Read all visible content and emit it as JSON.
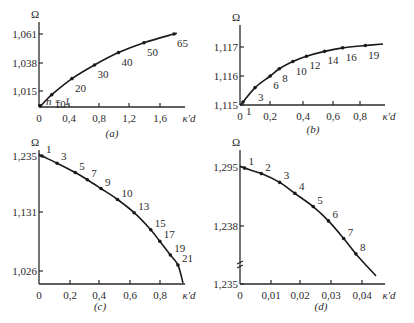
{
  "chart_data": [
    {
      "id": "a",
      "type": "line",
      "caption": "(a)",
      "ylabel": "Ω",
      "xlabel": "κ'd",
      "yticks": [
        "1,015",
        "1,038",
        "1,061"
      ],
      "xticks": [
        "0",
        "0,4",
        "0,8",
        "1,2",
        "1,6"
      ],
      "xlim": [
        0,
        1.9
      ],
      "ylim": [
        1.002,
        1.065
      ],
      "annotation": "n = 1",
      "points": [
        {
          "label": "1",
          "x": 0.02,
          "y": 1.003
        },
        {
          "label": "10",
          "x": 0.17,
          "y": 1.012
        },
        {
          "label": "20",
          "x": 0.44,
          "y": 1.025
        },
        {
          "label": "30",
          "x": 0.74,
          "y": 1.036
        },
        {
          "label": "40",
          "x": 1.06,
          "y": 1.046
        },
        {
          "label": "50",
          "x": 1.4,
          "y": 1.054
        },
        {
          "label": "65",
          "x": 1.8,
          "y": 1.061
        }
      ]
    },
    {
      "id": "b",
      "type": "line",
      "caption": "(b)",
      "ylabel": "Ω",
      "xlabel": "κ'd",
      "yticks": [
        "1,115",
        "1,116",
        "1,117"
      ],
      "xticks": [
        "0",
        "0,2",
        "0,4",
        "0,6",
        "0,8"
      ],
      "xlim": [
        0,
        0.95
      ],
      "ylim": [
        1.115,
        1.1175
      ],
      "points": [
        {
          "label": "1",
          "x": 0.02,
          "y": 1.1151
        },
        {
          "label": "3",
          "x": 0.1,
          "y": 1.1156
        },
        {
          "label": "6",
          "x": 0.2,
          "y": 1.116
        },
        {
          "label": "8",
          "x": 0.26,
          "y": 1.11625
        },
        {
          "label": "10",
          "x": 0.35,
          "y": 1.1165
        },
        {
          "label": "12",
          "x": 0.44,
          "y": 1.11668
        },
        {
          "label": "14",
          "x": 0.56,
          "y": 1.11685
        },
        {
          "label": "16",
          "x": 0.68,
          "y": 1.11697
        },
        {
          "label": "19",
          "x": 0.83,
          "y": 1.11705
        }
      ]
    },
    {
      "id": "c",
      "type": "line",
      "caption": "(c)",
      "ylabel": "Ω",
      "xlabel": "κ'd",
      "yticks": [
        "1,026",
        "1,131",
        "1,235"
      ],
      "xticks": [
        "0",
        "0,2",
        "0,4",
        "0,6",
        "0,8"
      ],
      "xlim": [
        0,
        0.95
      ],
      "ylim": [
        1.0,
        1.24
      ],
      "points": [
        {
          "label": "1",
          "x": 0.02,
          "y": 1.235
        },
        {
          "label": "3",
          "x": 0.12,
          "y": 1.222
        },
        {
          "label": "5",
          "x": 0.24,
          "y": 1.205
        },
        {
          "label": "7",
          "x": 0.32,
          "y": 1.192
        },
        {
          "label": "9",
          "x": 0.41,
          "y": 1.176
        },
        {
          "label": "10",
          "x": 0.52,
          "y": 1.156
        },
        {
          "label": "13",
          "x": 0.63,
          "y": 1.132
        },
        {
          "label": "15",
          "x": 0.74,
          "y": 1.101
        },
        {
          "label": "17",
          "x": 0.8,
          "y": 1.08
        },
        {
          "label": "19",
          "x": 0.87,
          "y": 1.055
        },
        {
          "label": "21",
          "x": 0.92,
          "y": 1.037
        }
      ]
    },
    {
      "id": "d",
      "type": "line",
      "caption": "(d)",
      "ylabel": "Ω",
      "xlabel": "κ'd",
      "yticks": [
        "1,235",
        "1,238",
        "1,295"
      ],
      "xticks": [
        "0",
        "0,01",
        "0,02",
        "0,03",
        "0,04"
      ],
      "xlim": [
        0,
        0.046
      ],
      "axis_break": true,
      "points": [
        {
          "label": "1",
          "x": 0.0015,
          "y": 1.294
        },
        {
          "label": "2",
          "x": 0.007,
          "y": 1.289
        },
        {
          "label": "3",
          "x": 0.013,
          "y": 1.281
        },
        {
          "label": "4",
          "x": 0.018,
          "y": 1.271
        },
        {
          "label": "5",
          "x": 0.024,
          "y": 1.259
        },
        {
          "label": "6",
          "x": 0.029,
          "y": 1.246
        },
        {
          "label": "7",
          "x": 0.034,
          "y": 1.23
        },
        {
          "label": "8",
          "x": 0.038,
          "y": 1.216
        }
      ]
    }
  ]
}
